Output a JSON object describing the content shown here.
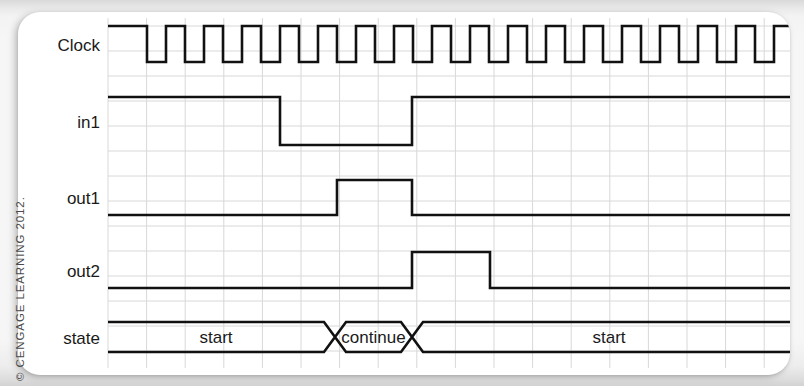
{
  "figure": {
    "kind": "digital-timing-diagram",
    "credit": "CENGAGE LEARNING 2012.",
    "copyright_symbol": "©",
    "background_color": "#f6f6f6",
    "card_color": "#ffffff",
    "waveform_color": "#111111",
    "grid_color": "#d8d8d8"
  },
  "axis": {
    "plot_left": 108,
    "plot_right": 795,
    "grid_step_x": 38.6,
    "grid_step_y": 25.0,
    "grid_visible": true
  },
  "signals": [
    {
      "name": "Clock",
      "label": "Clock",
      "row": 0,
      "type": "clock",
      "y_high": 26,
      "y_low": 62,
      "start_level": "high",
      "edges": [
        147,
        166,
        185,
        204,
        223,
        242,
        261,
        280,
        299,
        318,
        337,
        356,
        375,
        394,
        413,
        432,
        451,
        470,
        489,
        508,
        527,
        546,
        565,
        584,
        603,
        622,
        641,
        660,
        679,
        698,
        717,
        736,
        755,
        774,
        793
      ]
    },
    {
      "name": "in1",
      "label": "in1",
      "row": 1,
      "type": "signal",
      "y_high": 97,
      "y_low": 145,
      "start_level": "high",
      "edges": [
        280,
        412
      ]
    },
    {
      "name": "out1",
      "label": "out1",
      "row": 2,
      "type": "signal",
      "y_high": 180,
      "y_low": 215,
      "start_level": "low",
      "edges": [
        337,
        412
      ]
    },
    {
      "name": "out2",
      "label": "out2",
      "row": 3,
      "type": "signal",
      "y_high": 252,
      "y_low": 288,
      "start_level": "low",
      "edges": [
        412,
        490
      ]
    }
  ],
  "state_bus": {
    "name": "state",
    "label": "state",
    "row": 4,
    "y_high": 322,
    "y_low": 352,
    "transition_width": 11,
    "segments": [
      {
        "label": "start",
        "start": 108,
        "end": 335
      },
      {
        "label": "continue",
        "start": 335,
        "end": 412
      },
      {
        "label": "start",
        "start": 412,
        "end": 795
      }
    ]
  },
  "labels": {
    "label_x": 100,
    "clock_y": 51,
    "in1_y": 128,
    "out1_y": 204,
    "out2_y": 277,
    "state_y": 344
  }
}
